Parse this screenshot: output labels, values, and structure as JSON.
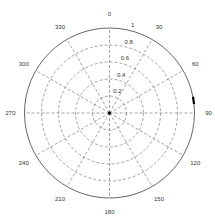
{
  "chart_data": {
    "type": "polar",
    "title": "",
    "angle_direction": "clockwise",
    "zero_location": "top",
    "angle_ticks": [
      0,
      30,
      60,
      90,
      120,
      150,
      180,
      210,
      240,
      270,
      300,
      330
    ],
    "angle_tick_labels": [
      "0",
      "30",
      "60",
      "90",
      "120",
      "150",
      "180",
      "210",
      "240",
      "270",
      "300",
      "330"
    ],
    "radial_ticks": [
      0.2,
      0.4,
      0.6,
      0.8,
      1
    ],
    "radial_tick_labels": [
      "0.2",
      "0.4",
      "0.6",
      "0.8",
      "1"
    ],
    "rlim": [
      0,
      1
    ],
    "grid": true,
    "grid_style": "dashed",
    "series": [
      {
        "name": "data",
        "color": "#000000",
        "points": [
          {
            "theta": 79,
            "r": 1
          },
          {
            "theta": 80,
            "r": 1
          },
          {
            "theta": 81,
            "r": 1
          },
          {
            "theta": 82,
            "r": 1
          },
          {
            "theta": 83,
            "r": 1
          },
          {
            "theta": 84,
            "r": 1
          }
        ]
      },
      {
        "name": "origin-point",
        "color": "#000000",
        "points": [
          {
            "theta": 0,
            "r": 0
          }
        ]
      }
    ]
  },
  "colors": {
    "outer_circle": "#555555",
    "grid": "#666666",
    "text": "#333333",
    "data": "#000000"
  }
}
